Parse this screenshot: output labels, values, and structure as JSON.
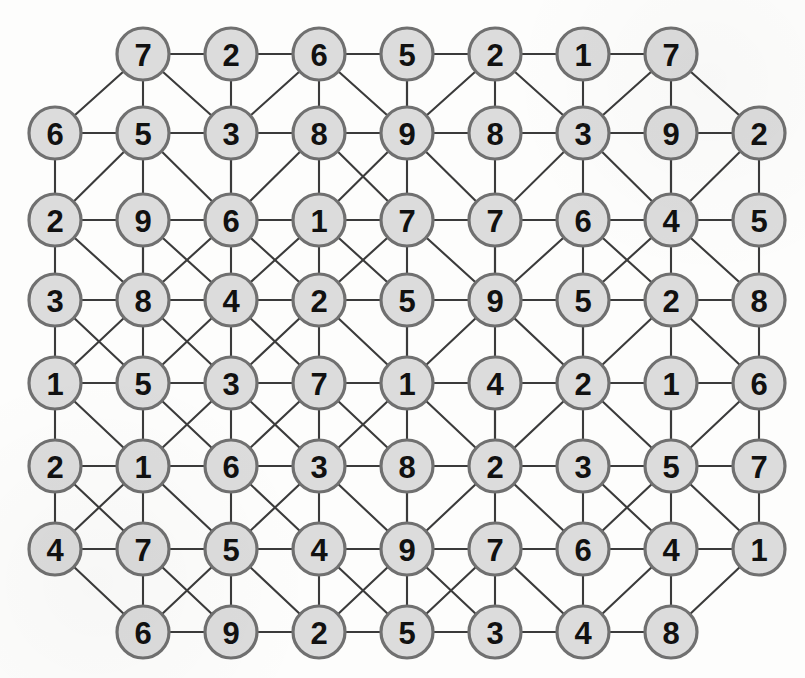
{
  "figure": {
    "title": "",
    "kind": "node-link-graph"
  },
  "style": {
    "node_fill": "#dcdcdc",
    "node_stroke": "#707070",
    "edge_color": "#3b3b3b",
    "label_color": "#111111",
    "background": "#fdfdfc"
  },
  "chart_data": {
    "type": "graph",
    "title": "",
    "node_count": 67,
    "rows": 8,
    "columns": 9,
    "column_x": [
      55,
      143,
      231,
      319,
      407,
      495,
      583,
      671,
      759
    ],
    "row_y": [
      54,
      133,
      220,
      300,
      383,
      466,
      549,
      632
    ],
    "nodes": [
      {
        "id": "r0c1",
        "row": 0,
        "col": 1,
        "value": 7,
        "x": 143,
        "y": 54
      },
      {
        "id": "r0c2",
        "row": 0,
        "col": 2,
        "value": 2,
        "x": 231,
        "y": 54
      },
      {
        "id": "r0c3",
        "row": 0,
        "col": 3,
        "value": 6,
        "x": 319,
        "y": 54
      },
      {
        "id": "r0c4",
        "row": 0,
        "col": 4,
        "value": 5,
        "x": 407,
        "y": 54
      },
      {
        "id": "r0c5",
        "row": 0,
        "col": 5,
        "value": 2,
        "x": 495,
        "y": 54
      },
      {
        "id": "r0c6",
        "row": 0,
        "col": 6,
        "value": 1,
        "x": 583,
        "y": 54
      },
      {
        "id": "r0c7",
        "row": 0,
        "col": 7,
        "value": 7,
        "x": 671,
        "y": 54
      },
      {
        "id": "r1c0",
        "row": 1,
        "col": 0,
        "value": 6,
        "x": 55,
        "y": 133
      },
      {
        "id": "r1c1",
        "row": 1,
        "col": 1,
        "value": 5,
        "x": 143,
        "y": 133
      },
      {
        "id": "r1c2",
        "row": 1,
        "col": 2,
        "value": 3,
        "x": 231,
        "y": 133
      },
      {
        "id": "r1c3",
        "row": 1,
        "col": 3,
        "value": 8,
        "x": 319,
        "y": 133
      },
      {
        "id": "r1c4",
        "row": 1,
        "col": 4,
        "value": 9,
        "x": 407,
        "y": 133
      },
      {
        "id": "r1c5",
        "row": 1,
        "col": 5,
        "value": 8,
        "x": 495,
        "y": 133
      },
      {
        "id": "r1c6",
        "row": 1,
        "col": 6,
        "value": 3,
        "x": 583,
        "y": 133
      },
      {
        "id": "r1c7",
        "row": 1,
        "col": 7,
        "value": 9,
        "x": 671,
        "y": 133
      },
      {
        "id": "r1c8",
        "row": 1,
        "col": 8,
        "value": 2,
        "x": 759,
        "y": 133
      },
      {
        "id": "r2c0",
        "row": 2,
        "col": 0,
        "value": 2,
        "x": 55,
        "y": 220
      },
      {
        "id": "r2c1",
        "row": 2,
        "col": 1,
        "value": 9,
        "x": 143,
        "y": 220
      },
      {
        "id": "r2c2",
        "row": 2,
        "col": 2,
        "value": 6,
        "x": 231,
        "y": 220
      },
      {
        "id": "r2c3",
        "row": 2,
        "col": 3,
        "value": 1,
        "x": 319,
        "y": 220
      },
      {
        "id": "r2c4",
        "row": 2,
        "col": 4,
        "value": 7,
        "x": 407,
        "y": 220
      },
      {
        "id": "r2c5",
        "row": 2,
        "col": 5,
        "value": 7,
        "x": 495,
        "y": 220
      },
      {
        "id": "r2c6",
        "row": 2,
        "col": 6,
        "value": 6,
        "x": 583,
        "y": 220
      },
      {
        "id": "r2c7",
        "row": 2,
        "col": 7,
        "value": 4,
        "x": 671,
        "y": 220
      },
      {
        "id": "r2c8",
        "row": 2,
        "col": 8,
        "value": 5,
        "x": 759,
        "y": 220
      },
      {
        "id": "r3c0",
        "row": 3,
        "col": 0,
        "value": 3,
        "x": 55,
        "y": 300
      },
      {
        "id": "r3c1",
        "row": 3,
        "col": 1,
        "value": 8,
        "x": 143,
        "y": 300
      },
      {
        "id": "r3c2",
        "row": 3,
        "col": 2,
        "value": 4,
        "x": 231,
        "y": 300
      },
      {
        "id": "r3c3",
        "row": 3,
        "col": 3,
        "value": 2,
        "x": 319,
        "y": 300
      },
      {
        "id": "r3c4",
        "row": 3,
        "col": 4,
        "value": 5,
        "x": 407,
        "y": 300
      },
      {
        "id": "r3c5",
        "row": 3,
        "col": 5,
        "value": 9,
        "x": 495,
        "y": 300
      },
      {
        "id": "r3c6",
        "row": 3,
        "col": 6,
        "value": 5,
        "x": 583,
        "y": 300
      },
      {
        "id": "r3c7",
        "row": 3,
        "col": 7,
        "value": 2,
        "x": 671,
        "y": 300
      },
      {
        "id": "r3c8",
        "row": 3,
        "col": 8,
        "value": 8,
        "x": 759,
        "y": 300
      },
      {
        "id": "r4c0",
        "row": 4,
        "col": 0,
        "value": 1,
        "x": 55,
        "y": 383
      },
      {
        "id": "r4c1",
        "row": 4,
        "col": 1,
        "value": 5,
        "x": 143,
        "y": 383
      },
      {
        "id": "r4c2",
        "row": 4,
        "col": 2,
        "value": 3,
        "x": 231,
        "y": 383
      },
      {
        "id": "r4c3",
        "row": 4,
        "col": 3,
        "value": 7,
        "x": 319,
        "y": 383
      },
      {
        "id": "r4c4",
        "row": 4,
        "col": 4,
        "value": 1,
        "x": 407,
        "y": 383
      },
      {
        "id": "r4c5",
        "row": 4,
        "col": 5,
        "value": 4,
        "x": 495,
        "y": 383
      },
      {
        "id": "r4c6",
        "row": 4,
        "col": 6,
        "value": 2,
        "x": 583,
        "y": 383
      },
      {
        "id": "r4c7",
        "row": 4,
        "col": 7,
        "value": 1,
        "x": 671,
        "y": 383
      },
      {
        "id": "r4c8",
        "row": 4,
        "col": 8,
        "value": 6,
        "x": 759,
        "y": 383
      },
      {
        "id": "r5c0",
        "row": 5,
        "col": 0,
        "value": 2,
        "x": 55,
        "y": 466
      },
      {
        "id": "r5c1",
        "row": 5,
        "col": 1,
        "value": 1,
        "x": 143,
        "y": 466
      },
      {
        "id": "r5c2",
        "row": 5,
        "col": 2,
        "value": 6,
        "x": 231,
        "y": 466
      },
      {
        "id": "r5c3",
        "row": 5,
        "col": 3,
        "value": 3,
        "x": 319,
        "y": 466
      },
      {
        "id": "r5c4",
        "row": 5,
        "col": 4,
        "value": 8,
        "x": 407,
        "y": 466
      },
      {
        "id": "r5c5",
        "row": 5,
        "col": 5,
        "value": 2,
        "x": 495,
        "y": 466
      },
      {
        "id": "r5c6",
        "row": 5,
        "col": 6,
        "value": 3,
        "x": 583,
        "y": 466
      },
      {
        "id": "r5c7",
        "row": 5,
        "col": 7,
        "value": 5,
        "x": 671,
        "y": 466
      },
      {
        "id": "r5c8",
        "row": 5,
        "col": 8,
        "value": 7,
        "x": 759,
        "y": 466
      },
      {
        "id": "r6c0",
        "row": 6,
        "col": 0,
        "value": 4,
        "x": 55,
        "y": 549
      },
      {
        "id": "r6c1",
        "row": 6,
        "col": 1,
        "value": 7,
        "x": 143,
        "y": 549
      },
      {
        "id": "r6c2",
        "row": 6,
        "col": 2,
        "value": 5,
        "x": 231,
        "y": 549
      },
      {
        "id": "r6c3",
        "row": 6,
        "col": 3,
        "value": 4,
        "x": 319,
        "y": 549
      },
      {
        "id": "r6c4",
        "row": 6,
        "col": 4,
        "value": 9,
        "x": 407,
        "y": 549
      },
      {
        "id": "r6c5",
        "row": 6,
        "col": 5,
        "value": 7,
        "x": 495,
        "y": 549
      },
      {
        "id": "r6c6",
        "row": 6,
        "col": 6,
        "value": 6,
        "x": 583,
        "y": 549
      },
      {
        "id": "r6c7",
        "row": 6,
        "col": 7,
        "value": 4,
        "x": 671,
        "y": 549
      },
      {
        "id": "r6c8",
        "row": 6,
        "col": 8,
        "value": 1,
        "x": 759,
        "y": 549
      },
      {
        "id": "r7c1",
        "row": 7,
        "col": 1,
        "value": 6,
        "x": 143,
        "y": 632
      },
      {
        "id": "r7c2",
        "row": 7,
        "col": 2,
        "value": 9,
        "x": 231,
        "y": 632
      },
      {
        "id": "r7c3",
        "row": 7,
        "col": 3,
        "value": 2,
        "x": 319,
        "y": 632
      },
      {
        "id": "r7c4",
        "row": 7,
        "col": 4,
        "value": 5,
        "x": 407,
        "y": 632
      },
      {
        "id": "r7c5",
        "row": 7,
        "col": 5,
        "value": 3,
        "x": 495,
        "y": 632
      },
      {
        "id": "r7c6",
        "row": 7,
        "col": 6,
        "value": 4,
        "x": 583,
        "y": 632
      },
      {
        "id": "r7c7",
        "row": 7,
        "col": 7,
        "value": 8,
        "x": 671,
        "y": 632
      }
    ],
    "edges": [
      [
        "r0c1",
        "r0c2"
      ],
      [
        "r0c2",
        "r0c3"
      ],
      [
        "r0c3",
        "r0c4"
      ],
      [
        "r0c4",
        "r0c5"
      ],
      [
        "r0c5",
        "r0c6"
      ],
      [
        "r0c6",
        "r0c7"
      ],
      [
        "r1c0",
        "r1c1"
      ],
      [
        "r1c1",
        "r1c2"
      ],
      [
        "r1c2",
        "r1c3"
      ],
      [
        "r1c3",
        "r1c4"
      ],
      [
        "r1c4",
        "r1c5"
      ],
      [
        "r1c5",
        "r1c6"
      ],
      [
        "r1c6",
        "r1c7"
      ],
      [
        "r1c7",
        "r1c8"
      ],
      [
        "r2c0",
        "r2c1"
      ],
      [
        "r2c1",
        "r2c2"
      ],
      [
        "r2c2",
        "r2c3"
      ],
      [
        "r2c3",
        "r2c4"
      ],
      [
        "r2c4",
        "r2c5"
      ],
      [
        "r2c5",
        "r2c6"
      ],
      [
        "r2c6",
        "r2c7"
      ],
      [
        "r2c7",
        "r2c8"
      ],
      [
        "r3c0",
        "r3c1"
      ],
      [
        "r3c1",
        "r3c2"
      ],
      [
        "r3c2",
        "r3c3"
      ],
      [
        "r3c3",
        "r3c4"
      ],
      [
        "r3c4",
        "r3c5"
      ],
      [
        "r3c5",
        "r3c6"
      ],
      [
        "r3c6",
        "r3c7"
      ],
      [
        "r3c7",
        "r3c8"
      ],
      [
        "r4c0",
        "r4c1"
      ],
      [
        "r4c1",
        "r4c2"
      ],
      [
        "r4c2",
        "r4c3"
      ],
      [
        "r4c3",
        "r4c4"
      ],
      [
        "r4c4",
        "r4c5"
      ],
      [
        "r4c5",
        "r4c6"
      ],
      [
        "r4c6",
        "r4c7"
      ],
      [
        "r4c7",
        "r4c8"
      ],
      [
        "r5c0",
        "r5c1"
      ],
      [
        "r5c1",
        "r5c2"
      ],
      [
        "r5c2",
        "r5c3"
      ],
      [
        "r5c3",
        "r5c4"
      ],
      [
        "r5c4",
        "r5c5"
      ],
      [
        "r5c5",
        "r5c6"
      ],
      [
        "r5c6",
        "r5c7"
      ],
      [
        "r5c7",
        "r5c8"
      ],
      [
        "r6c0",
        "r6c1"
      ],
      [
        "r6c1",
        "r6c2"
      ],
      [
        "r6c2",
        "r6c3"
      ],
      [
        "r6c3",
        "r6c4"
      ],
      [
        "r6c4",
        "r6c5"
      ],
      [
        "r6c5",
        "r6c6"
      ],
      [
        "r6c6",
        "r6c7"
      ],
      [
        "r6c7",
        "r6c8"
      ],
      [
        "r7c1",
        "r7c2"
      ],
      [
        "r7c2",
        "r7c3"
      ],
      [
        "r7c3",
        "r7c4"
      ],
      [
        "r7c4",
        "r7c5"
      ],
      [
        "r7c5",
        "r7c6"
      ],
      [
        "r7c6",
        "r7c7"
      ],
      [
        "r0c1",
        "r1c1"
      ],
      [
        "r0c2",
        "r1c2"
      ],
      [
        "r0c3",
        "r1c3"
      ],
      [
        "r0c4",
        "r1c4"
      ],
      [
        "r0c5",
        "r1c5"
      ],
      [
        "r0c6",
        "r1c6"
      ],
      [
        "r0c7",
        "r1c7"
      ],
      [
        "r1c0",
        "r2c0"
      ],
      [
        "r1c1",
        "r2c1"
      ],
      [
        "r1c2",
        "r2c2"
      ],
      [
        "r1c3",
        "r2c3"
      ],
      [
        "r1c4",
        "r2c4"
      ],
      [
        "r1c5",
        "r2c5"
      ],
      [
        "r1c6",
        "r2c6"
      ],
      [
        "r1c7",
        "r2c7"
      ],
      [
        "r1c8",
        "r2c8"
      ],
      [
        "r2c0",
        "r3c0"
      ],
      [
        "r2c1",
        "r3c1"
      ],
      [
        "r2c2",
        "r3c2"
      ],
      [
        "r2c3",
        "r3c3"
      ],
      [
        "r2c4",
        "r3c4"
      ],
      [
        "r2c5",
        "r3c5"
      ],
      [
        "r2c6",
        "r3c6"
      ],
      [
        "r2c7",
        "r3c7"
      ],
      [
        "r2c8",
        "r3c8"
      ],
      [
        "r3c0",
        "r4c0"
      ],
      [
        "r3c1",
        "r4c1"
      ],
      [
        "r3c2",
        "r4c2"
      ],
      [
        "r3c3",
        "r4c3"
      ],
      [
        "r3c4",
        "r4c4"
      ],
      [
        "r3c5",
        "r4c5"
      ],
      [
        "r3c6",
        "r4c6"
      ],
      [
        "r3c7",
        "r4c7"
      ],
      [
        "r3c8",
        "r4c8"
      ],
      [
        "r4c0",
        "r5c0"
      ],
      [
        "r4c1",
        "r5c1"
      ],
      [
        "r4c2",
        "r5c2"
      ],
      [
        "r4c3",
        "r5c3"
      ],
      [
        "r4c4",
        "r5c4"
      ],
      [
        "r4c5",
        "r5c5"
      ],
      [
        "r4c6",
        "r5c6"
      ],
      [
        "r4c7",
        "r5c7"
      ],
      [
        "r4c8",
        "r5c8"
      ],
      [
        "r5c0",
        "r6c0"
      ],
      [
        "r5c1",
        "r6c1"
      ],
      [
        "r5c2",
        "r6c2"
      ],
      [
        "r5c3",
        "r6c3"
      ],
      [
        "r5c4",
        "r6c4"
      ],
      [
        "r5c5",
        "r6c5"
      ],
      [
        "r5c6",
        "r6c6"
      ],
      [
        "r5c7",
        "r6c7"
      ],
      [
        "r5c8",
        "r6c8"
      ],
      [
        "r6c1",
        "r7c1"
      ],
      [
        "r6c2",
        "r7c2"
      ],
      [
        "r6c3",
        "r7c3"
      ],
      [
        "r6c4",
        "r7c4"
      ],
      [
        "r6c5",
        "r7c5"
      ],
      [
        "r6c6",
        "r7c6"
      ],
      [
        "r6c7",
        "r7c7"
      ],
      [
        "r0c1",
        "r1c0"
      ],
      [
        "r0c1",
        "r1c2"
      ],
      [
        "r0c3",
        "r1c2"
      ],
      [
        "r0c3",
        "r1c4"
      ],
      [
        "r0c4",
        "r1c4"
      ],
      [
        "r0c5",
        "r1c4"
      ],
      [
        "r0c5",
        "r1c6"
      ],
      [
        "r0c7",
        "r1c6"
      ],
      [
        "r0c7",
        "r1c8"
      ],
      [
        "r1c1",
        "r2c0"
      ],
      [
        "r1c1",
        "r2c2"
      ],
      [
        "r1c2",
        "r2c2"
      ],
      [
        "r1c3",
        "r2c2"
      ],
      [
        "r1c3",
        "r2c4"
      ],
      [
        "r1c4",
        "r2c3"
      ],
      [
        "r1c4",
        "r2c5"
      ],
      [
        "r1c6",
        "r2c5"
      ],
      [
        "r1c6",
        "r2c7"
      ],
      [
        "r1c7",
        "r2c7"
      ],
      [
        "r1c8",
        "r2c7"
      ],
      [
        "r2c0",
        "r3c1"
      ],
      [
        "r2c1",
        "r3c1"
      ],
      [
        "r2c1",
        "r3c2"
      ],
      [
        "r2c2",
        "r3c1"
      ],
      [
        "r2c2",
        "r3c3"
      ],
      [
        "r2c3",
        "r3c2"
      ],
      [
        "r2c3",
        "r3c4"
      ],
      [
        "r2c4",
        "r3c3"
      ],
      [
        "r2c4",
        "r3c5"
      ],
      [
        "r2c5",
        "r3c5"
      ],
      [
        "r2c6",
        "r3c5"
      ],
      [
        "r2c6",
        "r3c7"
      ],
      [
        "r2c7",
        "r3c6"
      ],
      [
        "r2c7",
        "r3c8"
      ],
      [
        "r3c0",
        "r4c1"
      ],
      [
        "r3c1",
        "r4c0"
      ],
      [
        "r3c1",
        "r4c2"
      ],
      [
        "r3c2",
        "r4c1"
      ],
      [
        "r3c2",
        "r4c3"
      ],
      [
        "r3c3",
        "r4c2"
      ],
      [
        "r3c3",
        "r4c4"
      ],
      [
        "r3c4",
        "r4c4"
      ],
      [
        "r3c5",
        "r4c4"
      ],
      [
        "r3c5",
        "r4c6"
      ],
      [
        "r3c6",
        "r4c6"
      ],
      [
        "r3c7",
        "r4c6"
      ],
      [
        "r3c7",
        "r4c8"
      ],
      [
        "r4c0",
        "r5c1"
      ],
      [
        "r4c1",
        "r5c2"
      ],
      [
        "r4c2",
        "r5c1"
      ],
      [
        "r4c2",
        "r5c3"
      ],
      [
        "r4c3",
        "r5c2"
      ],
      [
        "r4c3",
        "r5c4"
      ],
      [
        "r4c4",
        "r5c3"
      ],
      [
        "r4c4",
        "r5c5"
      ],
      [
        "r4c5",
        "r5c5"
      ],
      [
        "r4c6",
        "r5c5"
      ],
      [
        "r4c6",
        "r5c7"
      ],
      [
        "r4c7",
        "r5c7"
      ],
      [
        "r4c8",
        "r5c7"
      ],
      [
        "r5c0",
        "r6c1"
      ],
      [
        "r5c1",
        "r6c0"
      ],
      [
        "r5c1",
        "r6c2"
      ],
      [
        "r5c2",
        "r6c3"
      ],
      [
        "r5c3",
        "r6c2"
      ],
      [
        "r5c3",
        "r6c4"
      ],
      [
        "r5c4",
        "r6c4"
      ],
      [
        "r5c5",
        "r6c4"
      ],
      [
        "r5c5",
        "r6c6"
      ],
      [
        "r5c6",
        "r6c7"
      ],
      [
        "r5c7",
        "r6c6"
      ],
      [
        "r5c7",
        "r6c8"
      ],
      [
        "r6c0",
        "r7c1"
      ],
      [
        "r6c1",
        "r7c2"
      ],
      [
        "r6c2",
        "r7c1"
      ],
      [
        "r6c2",
        "r7c3"
      ],
      [
        "r6c3",
        "r7c4"
      ],
      [
        "r6c4",
        "r7c3"
      ],
      [
        "r6c4",
        "r7c5"
      ],
      [
        "r6c5",
        "r7c4"
      ],
      [
        "r6c5",
        "r7c6"
      ],
      [
        "r6c7",
        "r7c6"
      ],
      [
        "r6c8",
        "r7c7"
      ]
    ]
  }
}
